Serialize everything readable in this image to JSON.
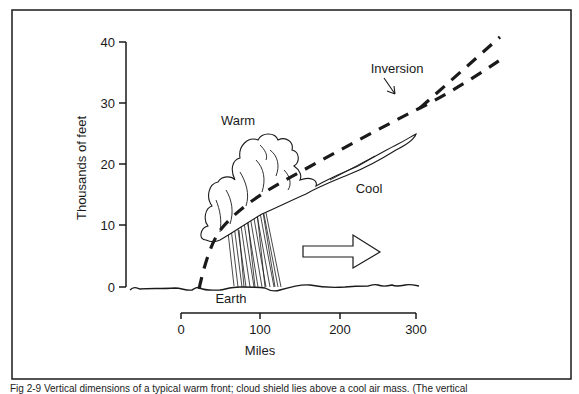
{
  "figure": {
    "y_axis": {
      "label": "Thousands of feet",
      "ticks": [
        "40",
        "30",
        "20",
        "10",
        "0"
      ]
    },
    "x_axis": {
      "label": "Miles",
      "ticks": [
        "0",
        "100",
        "200",
        "300"
      ]
    },
    "labels": {
      "warm": "Warm",
      "cool": "Cool",
      "inversion": "Inversion",
      "earth": "Earth"
    },
    "caption": "Fig 2-9 Vertical dimensions of a typical warm front; cloud shield lies above a cool air mass. (The vertical"
  },
  "colors": {
    "ink": "#1a1a1a",
    "background": "#ffffff"
  }
}
